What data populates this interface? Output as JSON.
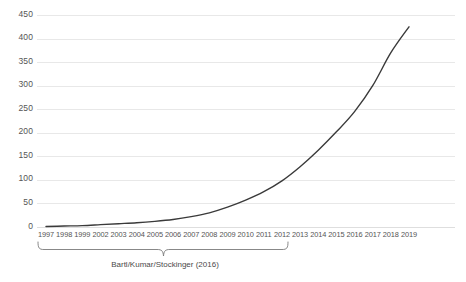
{
  "chart_data": {
    "type": "line",
    "title": "",
    "subtitle": "",
    "xlabel": "",
    "ylabel": "",
    "categories": [
      "1997",
      "1998",
      "1999",
      "2002",
      "2003",
      "2004",
      "2005",
      "2006",
      "2007",
      "2008",
      "2009",
      "2010",
      "2011",
      "2012",
      "2013",
      "2014",
      "2015",
      "2016",
      "2017",
      "2018",
      "2019"
    ],
    "values": [
      1,
      2,
      3,
      5,
      7,
      9,
      12,
      16,
      22,
      30,
      42,
      57,
      75,
      98,
      128,
      163,
      202,
      245,
      300,
      370,
      425
    ],
    "series": [
      {
        "name": "cumulative count",
        "values": [
          1,
          2,
          3,
          5,
          7,
          9,
          12,
          16,
          22,
          30,
          42,
          57,
          75,
          98,
          128,
          163,
          202,
          245,
          300,
          370,
          425
        ]
      }
    ],
    "ylim": [
      0,
      450
    ],
    "yticks": [
      0,
      50,
      100,
      150,
      200,
      250,
      300,
      350,
      400,
      450
    ],
    "ytick_labels": [
      "0",
      "50",
      "100",
      "150",
      "200",
      "250",
      "300",
      "350",
      "400",
      "450"
    ],
    "grid": true,
    "grid_axis": "y",
    "legend": false,
    "legend_position": "none",
    "line_color": "#3a3a3a",
    "grid_color": "#e8e8e8",
    "background_color": "#ffffff",
    "annotations": [
      {
        "type": "brace",
        "label": "Bartl/Kumar/Stockinger (2016)",
        "from_category": "1997",
        "to_category": "2012"
      }
    ]
  },
  "annotation": {
    "label": "Bartl/Kumar/Stockinger (2016)"
  },
  "axes": {
    "y_tick_labels": [
      "450",
      "400",
      "350",
      "300",
      "250",
      "200",
      "150",
      "100",
      "50",
      "0"
    ],
    "x_tick_labels": [
      "1997",
      "1998",
      "1999",
      "2002",
      "2003",
      "2004",
      "2005",
      "2006",
      "2007",
      "2008",
      "2009",
      "2010",
      "2011",
      "2012",
      "2013",
      "2014",
      "2015",
      "2016",
      "2017",
      "2018",
      "2019"
    ]
  }
}
